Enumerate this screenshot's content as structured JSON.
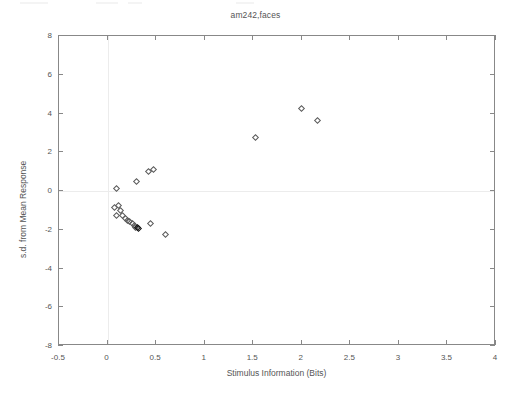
{
  "chart_data": {
    "type": "scatter",
    "title": "am242,faces",
    "xlabel": "Stimulus Information (Bits)",
    "ylabel": "s.d. from Mean Response",
    "xlim": [
      -0.5,
      4
    ],
    "ylim": [
      -8,
      8
    ],
    "xticks": [
      -0.5,
      0,
      0.5,
      1,
      1.5,
      2,
      2.5,
      3,
      3.5,
      4
    ],
    "xticklabels": [
      "-0.5",
      "0",
      "0.5",
      "1",
      "1.5",
      "2",
      "2.5",
      "3",
      "3.5",
      "4"
    ],
    "yticks": [
      -8,
      -6,
      -4,
      -2,
      0,
      2,
      4,
      6,
      8
    ],
    "yticklabels": [
      "-8",
      "-6",
      "-4",
      "-2",
      "0",
      "2",
      "4",
      "6",
      "8"
    ],
    "grid": false,
    "reference_lines": [
      {
        "name": "x-zero-line",
        "axis": "vertical",
        "value": 0
      },
      {
        "name": "y-zero-line",
        "axis": "horizontal",
        "value": 0
      }
    ],
    "marker": "diamond-open",
    "legend": null,
    "points": [
      {
        "x": 0.105,
        "y": 0.1
      },
      {
        "x": 0.085,
        "y": -0.9
      },
      {
        "x": 0.125,
        "y": -0.8
      },
      {
        "x": 0.145,
        "y": -1.05
      },
      {
        "x": 0.105,
        "y": -1.3
      },
      {
        "x": 0.165,
        "y": -1.3
      },
      {
        "x": 0.19,
        "y": -1.45
      },
      {
        "x": 0.215,
        "y": -1.55
      },
      {
        "x": 0.24,
        "y": -1.62
      },
      {
        "x": 0.265,
        "y": -1.72
      },
      {
        "x": 0.285,
        "y": -1.85
      },
      {
        "x": 0.3,
        "y": -1.92
      },
      {
        "x": 0.315,
        "y": -1.95
      },
      {
        "x": 0.33,
        "y": -1.98
      },
      {
        "x": 0.31,
        "y": 0.45
      },
      {
        "x": 0.43,
        "y": 0.95
      },
      {
        "x": 0.48,
        "y": 1.05
      },
      {
        "x": 0.45,
        "y": -1.75
      },
      {
        "x": 0.605,
        "y": -2.3
      },
      {
        "x": 1.53,
        "y": 2.7
      },
      {
        "x": 2.005,
        "y": 4.2
      },
      {
        "x": 2.17,
        "y": 3.6
      }
    ],
    "dark_points": [
      {
        "x": 0.315,
        "y": -1.95
      },
      {
        "x": 0.33,
        "y": -1.98
      }
    ]
  }
}
